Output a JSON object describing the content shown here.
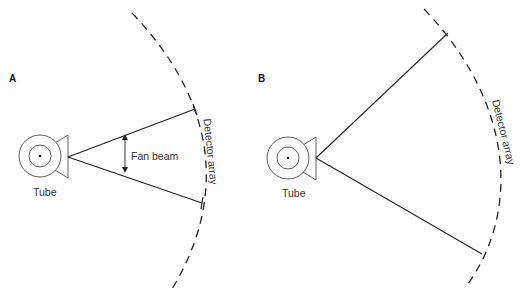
{
  "panels": [
    {
      "id": "A",
      "label": "A",
      "tube_label": "Tube",
      "detector_label": "Detector array",
      "beam_label": "Fan beam"
    },
    {
      "id": "B",
      "label": "B",
      "tube_label": "Tube",
      "detector_label": "Detector array"
    }
  ],
  "colors": {
    "stroke": "#222222",
    "text": "#333333",
    "background": "#ffffff"
  }
}
